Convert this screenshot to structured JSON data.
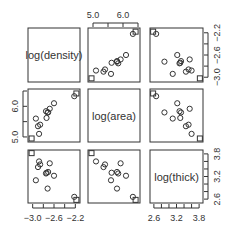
{
  "chart_data": {
    "type": "scatter",
    "title": "",
    "subtype": "scatterplot-matrix",
    "variables": [
      "log(density)",
      "log(area)",
      "log(thick)"
    ],
    "axes": {
      "log(density)": {
        "ticks": [
          -3.0,
          -2.8,
          -2.6,
          -2.4,
          -2.2
        ],
        "tick_labels": [
          "-3.0",
          "-2.6",
          "-2.2"
        ],
        "range": [
          -3.05,
          -2.15
        ]
      },
      "log(area)": {
        "ticks": [
          5.0,
          5.5,
          6.0,
          6.5
        ],
        "tick_labels": [
          "5.0",
          "6.0"
        ],
        "range": [
          4.9,
          6.5
        ]
      },
      "log(thick)": {
        "ticks": [
          2.6,
          2.8,
          3.0,
          3.2,
          3.4,
          3.6,
          3.8
        ],
        "tick_labels": [
          "2.6",
          "3.2",
          "3.8"
        ],
        "range": [
          2.55,
          3.85
        ]
      }
    },
    "observations": [
      {
        "density": -3.02,
        "area": 4.95,
        "thick": 3.82,
        "marker": "square"
      },
      {
        "density": -2.18,
        "area": 6.42,
        "thick": 2.58,
        "marker": "square"
      },
      {
        "density": -2.22,
        "area": 6.33,
        "thick": 2.66,
        "marker": "circle"
      },
      {
        "density": -2.68,
        "area": 5.92,
        "thick": 3.55,
        "marker": "circle"
      },
      {
        "density": -2.74,
        "area": 5.62,
        "thick": 3.3,
        "marker": "circle"
      },
      {
        "density": -2.71,
        "area": 5.8,
        "thick": 3.32,
        "marker": "circle"
      },
      {
        "density": -2.75,
        "area": 5.84,
        "thick": 3.28,
        "marker": "circle"
      },
      {
        "density": -2.6,
        "area": 6.1,
        "thick": 3.22,
        "marker": "circle"
      },
      {
        "density": -2.9,
        "area": 5.35,
        "thick": 3.45,
        "marker": "circle"
      },
      {
        "density": -2.86,
        "area": 5.4,
        "thick": 3.52,
        "marker": "circle"
      },
      {
        "density": -2.94,
        "area": 5.6,
        "thick": 3.1,
        "marker": "circle"
      },
      {
        "density": -2.72,
        "area": 5.8,
        "thick": 2.88,
        "marker": "circle"
      },
      {
        "density": -2.88,
        "area": 5.1,
        "thick": 3.6,
        "marker": "circle"
      }
    ],
    "diagonal_labels": [
      "log(density)",
      "log(area)",
      "log(thick)"
    ],
    "grid": false,
    "legend": null
  },
  "colors": {
    "axis": "#333333",
    "point": "#333333",
    "background": "#ffffff"
  }
}
